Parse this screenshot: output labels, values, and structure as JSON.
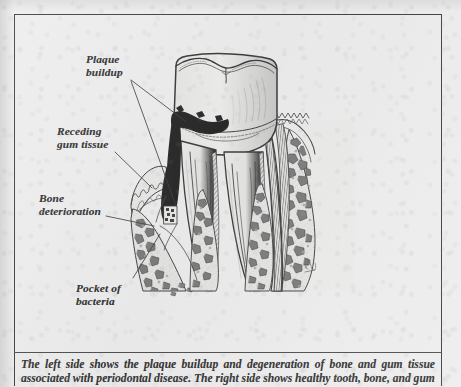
{
  "figure": {
    "kind": "anatomical-illustration",
    "background_color": "#ececec",
    "ink_color": "#1f1f1f",
    "plaque_color": "#111111",
    "frame": {
      "border_color": "#2a2a2a",
      "caption_rule_color": "#3a3a3a"
    }
  },
  "labels": [
    {
      "id": "plaque-buildup",
      "text": "Plaque\nbuildup",
      "side": "left",
      "leader_lines": 2
    },
    {
      "id": "receding-gum-tissue",
      "text": "Receding\ngum tissue",
      "side": "left",
      "leader_lines": 1
    },
    {
      "id": "bone-deterioration",
      "text": "Bone\ndeterioration",
      "side": "left",
      "leader_lines": 1
    },
    {
      "id": "pocket-of-bacteria",
      "text": "Pocket of\nbacteria",
      "side": "left",
      "leader_lines": 1
    }
  ],
  "caption": {
    "text": "The left side shows the plaque buildup and degeneration of bone and gum tissue associated with periodontal disease. The right side shows healthy tooth, bone, and gum"
  },
  "illustration_parts": {
    "crown": "molar crown with two cusps and occlusal groove",
    "roots": "three tapered roots with pulp canals",
    "diseased_side": "black plaque deposit, receding gum margin, deteriorated alveolar bone, bacterial pocket",
    "healthy_side": "intact gum collar, dense trabecular alveolar bone, periodontal ligament",
    "signature": "artist initials at lower right of bone"
  }
}
